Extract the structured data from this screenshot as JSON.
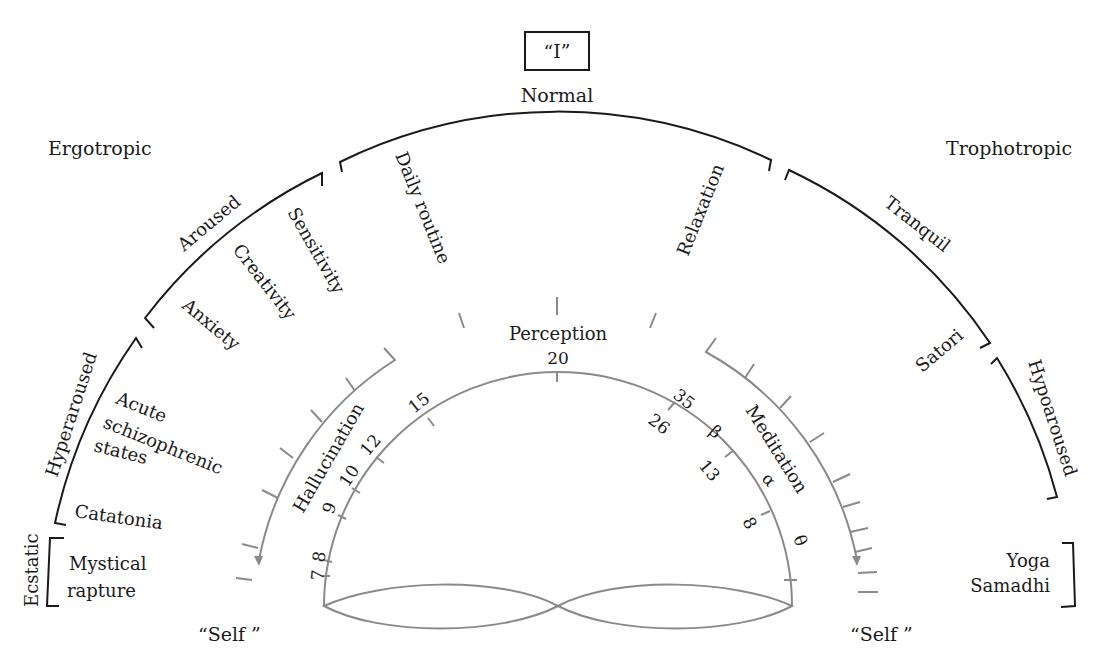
{
  "diagram": {
    "title_box": "“I”",
    "top_label": "Normal",
    "left_pole": "Ergotropic",
    "right_pole": "Trophotropic",
    "self_left": "“Self ”",
    "self_right": "“Self ”",
    "outer_arcs": {
      "normal": {
        "label": "Normal",
        "items": [
          "Daily routine",
          "Relaxation"
        ]
      },
      "aroused": {
        "label": "Aroused",
        "items": [
          "Sensitivity",
          "Creativity",
          "Anxiety"
        ]
      },
      "hyperaroused": {
        "label": "Hyperaroused",
        "items": [
          "Acute",
          "schizophrenic",
          "states",
          "Catatonia"
        ]
      },
      "ecstatic": {
        "label": "Ecstatic",
        "items": [
          "Mystical",
          "rapture"
        ]
      },
      "tranquil": {
        "label": "Tranquil",
        "items": [
          "Satori"
        ]
      },
      "hypoaroused": {
        "label": "Hypoaroused",
        "items": []
      },
      "yoga": {
        "label": "",
        "items": [
          "Yoga",
          "Samadhi"
        ]
      }
    },
    "inner": {
      "perception_label": "Perception",
      "hallucination_label": "Hallucination",
      "meditation_label": "Meditation",
      "top_value": "20",
      "left_scale": [
        "15",
        "12",
        "10",
        "9",
        "8",
        "7"
      ],
      "right_scale_outer": [
        "35"
      ],
      "right_scale_inner": [
        "26",
        "13",
        "8"
      ],
      "greek": [
        "β",
        "α",
        "θ"
      ]
    },
    "colors": {
      "ink": "#1a1a1a",
      "gray_line": "#8a8a8a",
      "background": "#ffffff"
    }
  }
}
